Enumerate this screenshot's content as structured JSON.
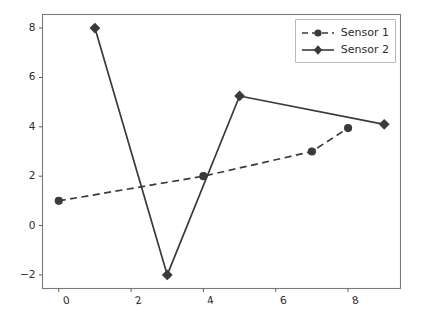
{
  "chart_data": {
    "type": "line",
    "title": "",
    "xlabel": "",
    "ylabel": "",
    "xlim": [
      -0.45,
      9.45
    ],
    "ylim": [
      -2.55,
      8.55
    ],
    "xticks": [
      0,
      2,
      4,
      6,
      8
    ],
    "xtick_labels": [
      "0",
      "2",
      "4",
      "6",
      "8"
    ],
    "yticks": [
      -2,
      0,
      2,
      4,
      6,
      8
    ],
    "ytick_labels": [
      "−2",
      "0",
      "2",
      "4",
      "6",
      "8"
    ],
    "grid": false,
    "legend_position": "upper right",
    "series": [
      {
        "name": "Sensor 1",
        "linestyle": "dashed",
        "marker": "circle",
        "color": "#3a3a3a",
        "x": [
          0,
          4,
          7,
          8
        ],
        "y": [
          1,
          2,
          3,
          3.95
        ],
        "points": [
          {
            "x": 0,
            "y": 1
          },
          {
            "x": 4,
            "y": 2
          },
          {
            "x": 7,
            "y": 3
          },
          {
            "x": 8,
            "y": 3.95
          }
        ]
      },
      {
        "name": "Sensor 2",
        "linestyle": "solid",
        "marker": "diamond",
        "color": "#3a3a3a",
        "x": [
          1,
          3,
          5,
          9
        ],
        "y": [
          8,
          -2,
          5.25,
          4.1
        ],
        "points": [
          {
            "x": 1,
            "y": 8
          },
          {
            "x": 3,
            "y": -2
          },
          {
            "x": 5,
            "y": 5.25
          },
          {
            "x": 9,
            "y": 4.1
          }
        ]
      }
    ],
    "axes": {
      "frame_color": "#7a7a7a",
      "background": "#ffffff",
      "tick_color": "#5c5c5c",
      "label_color": "#2b2b2b"
    },
    "legend": {
      "entries": [
        "Sensor 1",
        "Sensor 2"
      ],
      "border_color": "#b8b8b8",
      "background": "#ffffff"
    }
  }
}
